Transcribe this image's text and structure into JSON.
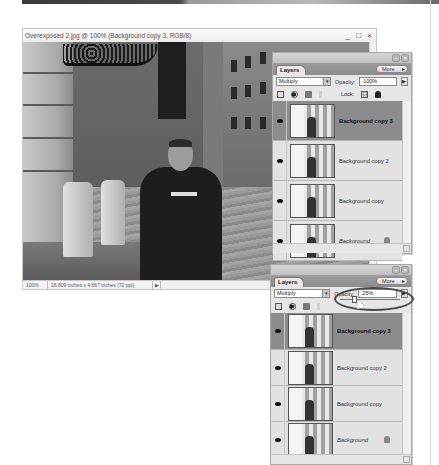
{
  "document_window": {
    "title": "Overexposed 2.jpg @ 100% (Background copy 3, RGB/8)",
    "controls": "_ □ ×",
    "status": {
      "zoom": "100%",
      "info": "18.809 inches x 4.667 inches (72 ppi)",
      "arrow": "▶"
    }
  },
  "layers_panel_1": {
    "tab_label": "Layers",
    "more_label": "More",
    "blend_mode": "Multiply",
    "opacity_label": "Opacity:",
    "opacity_value": "100%",
    "opacity_arrow": "▶",
    "lock_label": "Lock:",
    "layers": [
      {
        "name": "Background copy 3",
        "selected": true,
        "locked": false
      },
      {
        "name": "Background copy 2",
        "selected": false,
        "locked": false
      },
      {
        "name": "Background copy",
        "selected": false,
        "locked": false
      },
      {
        "name": "Background",
        "selected": false,
        "locked": true
      }
    ]
  },
  "layers_panel_2": {
    "tab_label": "Layers",
    "more_label": "More",
    "blend_mode": "Multiply",
    "opacity_label": "Opacity:",
    "opacity_value": "25%",
    "opacity_arrow": "▶",
    "lock_label": "Lock:",
    "layers": [
      {
        "name": "Background copy 3",
        "selected": true,
        "locked": false
      },
      {
        "name": "Background copy 2",
        "selected": false,
        "locked": false
      },
      {
        "name": "Background copy",
        "selected": false,
        "locked": false
      },
      {
        "name": "Background",
        "selected": false,
        "locked": true
      }
    ]
  },
  "colors": {
    "selected_layer": "#8c8c8c",
    "panel_bg": "#e6e6e6",
    "tabbar": "#959595"
  }
}
